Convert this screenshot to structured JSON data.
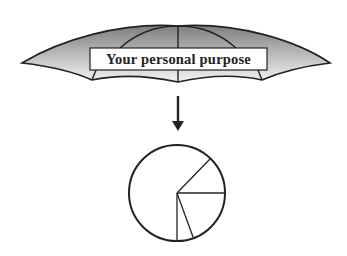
{
  "umbrella": {
    "label": "Your personal purpose"
  },
  "arrow": {
    "direction": "down"
  },
  "pie": {
    "segments": 5
  },
  "colors": {
    "canopy_dark": "#8a8a8a",
    "canopy_light": "#ffffff",
    "stroke": "#222222"
  }
}
